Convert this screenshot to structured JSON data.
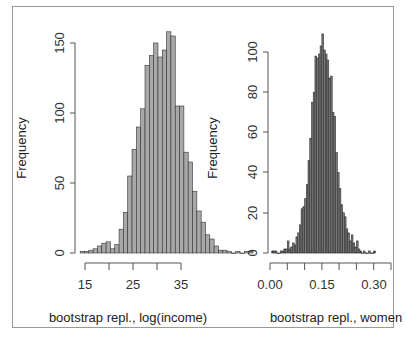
{
  "chart_data": [
    {
      "type": "bar",
      "subtype": "histogram",
      "title": "",
      "xlabel": "bootstrap repl., log(income)",
      "ylabel": "Frequency",
      "xticks": [
        "15",
        "20",
        "25",
        "30",
        "35"
      ],
      "xtick_labels_shown": [
        "15",
        "25",
        "35"
      ],
      "yticks": [
        "0",
        "50",
        "100",
        "150"
      ],
      "xlim": [
        14,
        40
      ],
      "ylim": [
        0,
        160
      ],
      "bin_start": 14,
      "bin_width": 0.9,
      "values": [
        1,
        1,
        2,
        3,
        5,
        7,
        8,
        3,
        6,
        17,
        29,
        55,
        74,
        90,
        103,
        134,
        141,
        150,
        140,
        145,
        158,
        155,
        105,
        105,
        72,
        65,
        44,
        30,
        22,
        13,
        10,
        5,
        2,
        2,
        1,
        0,
        1,
        0,
        1,
        1
      ],
      "color": "#a8a8a8",
      "edge": "#333333",
      "grid": false
    },
    {
      "type": "bar",
      "subtype": "histogram",
      "title": "",
      "xlabel": "bootstrap repl., women",
      "ylabel": "Frequency",
      "xticks": [
        "0.00",
        "0.05",
        "0.10",
        "0.15",
        "0.20",
        "0.25",
        "0.30",
        "0.35"
      ],
      "xtick_labels_shown": [
        "0.00",
        "0.15",
        "0.30"
      ],
      "yticks": [
        "0",
        "20",
        "40",
        "60",
        "80",
        "100"
      ],
      "xlim": [
        0.0,
        0.35
      ],
      "ylim": [
        0,
        110
      ],
      "bin_start": 0.005,
      "bin_width": 0.005,
      "values": [
        1,
        1,
        1,
        0,
        0,
        1,
        1,
        2,
        2,
        6,
        2,
        3,
        5,
        4,
        8,
        10,
        14,
        22,
        23,
        27,
        34,
        46,
        57,
        75,
        80,
        98,
        97,
        99,
        103,
        109,
        101,
        99,
        96,
        87,
        88,
        70,
        68,
        50,
        40,
        32,
        24,
        20,
        18,
        12,
        10,
        6,
        9,
        5,
        3,
        6,
        2,
        1,
        0,
        1,
        0,
        0,
        1,
        0,
        0,
        1
      ],
      "color": "#777777",
      "edge": "#333333",
      "grid": false
    }
  ],
  "left": {
    "ylabel": "Frequency",
    "xlabel": "bootstrap repl., log(income)",
    "yticks": [
      "0",
      "50",
      "100",
      "150"
    ],
    "xticks": [
      "15",
      "25",
      "35"
    ]
  },
  "right": {
    "ylabel": "Frequency",
    "xlabel": "bootstrap repl., women",
    "yticks": [
      "0",
      "20",
      "40",
      "60",
      "80",
      "100"
    ],
    "xticks": [
      "0.00",
      "0.15",
      "0.30"
    ]
  }
}
